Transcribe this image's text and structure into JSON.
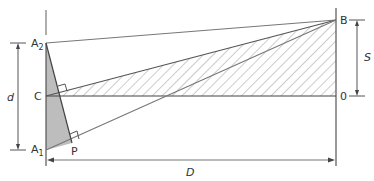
{
  "diagram": {
    "type": "geometry-figure",
    "colors": {
      "line": "#555555",
      "light_line": "#8a8a8a",
      "shade": "#bdbdbd",
      "hatch": "#9a9a9a",
      "text": "#333333"
    },
    "points": {
      "A2": {
        "label": "A",
        "sub": "2",
        "x": 46,
        "y": 43
      },
      "C": {
        "label": "C",
        "x": 46,
        "y": 96
      },
      "A1": {
        "label": "A",
        "sub": "1",
        "x": 46,
        "y": 150
      },
      "P": {
        "label": "P",
        "x": 72,
        "y": 143
      },
      "B": {
        "label": "B",
        "x": 336,
        "y": 20
      },
      "O": {
        "label": "0",
        "x": 336,
        "y": 96
      }
    },
    "dimensions": {
      "d": {
        "label": "d"
      },
      "S": {
        "label": "S"
      },
      "D": {
        "label": "D"
      }
    },
    "regions": {
      "hatched": "triangle C-B-O",
      "shaded": "triangle A2-A1-P"
    }
  }
}
